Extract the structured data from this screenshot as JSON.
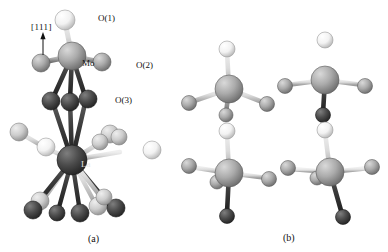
{
  "figure": {
    "background_color": "#ffffff",
    "width": 388,
    "height": 252
  },
  "panels": [
    {
      "id": "a",
      "caption": "(a)",
      "caption_x": 88,
      "caption_y": 234,
      "description": "MoO6 octahedron linked to LaO12 polyhedron viewed along [111]"
    },
    {
      "id": "b",
      "caption": "(b)",
      "caption_x": 283,
      "caption_y": 233,
      "description": "Four MoO6 coordination units shown in 2x2 arrangement"
    }
  ],
  "direction_indicator": {
    "label": "[111]",
    "label_x": 31,
    "label_y": 23,
    "arrow_from_x": 43,
    "arrow_from_y": 55,
    "arrow_to_x": 43,
    "arrow_to_y": 36
  },
  "atom_labels": [
    {
      "text": "O(1)",
      "x": 98,
      "y": 14,
      "style": "plain"
    },
    {
      "text": "Mo",
      "x": 82,
      "y": 59,
      "style": "on-sphere"
    },
    {
      "text": "O(2)",
      "x": 136,
      "y": 61,
      "style": "plain"
    },
    {
      "text": "O(3)",
      "x": 115,
      "y": 96,
      "style": "plain"
    },
    {
      "text": "La",
      "x": 81,
      "y": 160,
      "style": "on-dark"
    }
  ],
  "colors": {
    "atom_white_fill": "#fdfdfd",
    "atom_white_highlight": "#ffffff",
    "atom_white_shadow": "#b9b9b9",
    "atom_gray_fill": "#a8a8a8",
    "atom_gray_highlight": "#d8d8d8",
    "atom_gray_shadow": "#6e6e6e",
    "atom_dark_fill": "#4a4a4a",
    "atom_dark_highlight": "#7d7d7d",
    "atom_dark_shadow": "#242424",
    "atom_mid_fill": "#9a9a9a",
    "atom_lightgray_fill": "#c9c9c9",
    "bond_light": "#d2d2d2",
    "bond_gray": "#9e9e9e",
    "bond_dark": "#3a3a3a",
    "outline": "#4f4f4f",
    "text": "#111111"
  },
  "panel_a": {
    "bonds": [
      {
        "x1": 72,
        "y1": 56,
        "x2": 65,
        "y2": 22,
        "w": 5.0,
        "shade": "light"
      },
      {
        "x1": 72,
        "y1": 56,
        "x2": 44,
        "y2": 62,
        "w": 5.0,
        "shade": "gray"
      },
      {
        "x1": 72,
        "y1": 56,
        "x2": 100,
        "y2": 62,
        "w": 5.0,
        "shade": "gray"
      },
      {
        "x1": 72,
        "y1": 56,
        "x2": 52,
        "y2": 100,
        "w": 4.6,
        "shade": "dark"
      },
      {
        "x1": 72,
        "y1": 56,
        "x2": 70,
        "y2": 100,
        "w": 4.6,
        "shade": "dark"
      },
      {
        "x1": 72,
        "y1": 56,
        "x2": 86,
        "y2": 99,
        "w": 4.6,
        "shade": "dark"
      },
      {
        "x1": 72,
        "y1": 160,
        "x2": 52,
        "y2": 100,
        "w": 4.6,
        "shade": "dark"
      },
      {
        "x1": 72,
        "y1": 160,
        "x2": 70,
        "y2": 100,
        "w": 4.6,
        "shade": "dark"
      },
      {
        "x1": 72,
        "y1": 160,
        "x2": 86,
        "y2": 99,
        "w": 4.6,
        "shade": "dark"
      },
      {
        "x1": 72,
        "y1": 160,
        "x2": 44,
        "y2": 147,
        "w": 4.4,
        "shade": "light"
      },
      {
        "x1": 44,
        "y1": 147,
        "x2": 20,
        "y2": 133,
        "w": 4.4,
        "shade": "light"
      },
      {
        "x1": 72,
        "y1": 160,
        "x2": 100,
        "y2": 143,
        "w": 4.4,
        "shade": "light"
      },
      {
        "x1": 72,
        "y1": 160,
        "x2": 110,
        "y2": 136,
        "w": 4.4,
        "shade": "light"
      },
      {
        "x1": 72,
        "y1": 160,
        "x2": 120,
        "y2": 152,
        "w": 4.4,
        "shade": "light"
      },
      {
        "x1": 72,
        "y1": 160,
        "x2": 43,
        "y2": 200,
        "w": 4.4,
        "shade": "light"
      },
      {
        "x1": 72,
        "y1": 160,
        "x2": 35,
        "y2": 206,
        "w": 4.4,
        "shade": "dark"
      },
      {
        "x1": 72,
        "y1": 160,
        "x2": 58,
        "y2": 211,
        "w": 4.4,
        "shade": "dark"
      },
      {
        "x1": 72,
        "y1": 160,
        "x2": 80,
        "y2": 212,
        "w": 4.4,
        "shade": "dark"
      },
      {
        "x1": 72,
        "y1": 160,
        "x2": 96,
        "y2": 205,
        "w": 4.4,
        "shade": "light"
      },
      {
        "x1": 72,
        "y1": 160,
        "x2": 112,
        "y2": 208,
        "w": 4.4,
        "shade": "dark"
      },
      {
        "x1": 72,
        "y1": 160,
        "x2": 100,
        "y2": 196,
        "w": 4.4,
        "shade": "light"
      }
    ],
    "atoms": [
      {
        "x": 65,
        "y": 20,
        "r": 10,
        "kind": "white",
        "name": "oxygen-o1"
      },
      {
        "x": 41,
        "y": 63,
        "r": 9,
        "kind": "gray",
        "name": "oxygen-equatorial-left"
      },
      {
        "x": 102,
        "y": 62,
        "r": 9,
        "kind": "gray",
        "name": "oxygen-o2"
      },
      {
        "x": 72,
        "y": 56,
        "r": 14,
        "kind": "gray",
        "name": "molybdenum"
      },
      {
        "x": 51,
        "y": 101,
        "r": 9,
        "kind": "dark",
        "name": "oxygen-o3-a"
      },
      {
        "x": 70,
        "y": 102,
        "r": 9,
        "kind": "dark",
        "name": "oxygen-o3-b"
      },
      {
        "x": 88,
        "y": 99,
        "r": 9,
        "kind": "dark",
        "name": "oxygen-o3-c"
      },
      {
        "x": 19,
        "y": 132,
        "r": 9,
        "kind": "lightgray",
        "name": "oxygen-la-1"
      },
      {
        "x": 46,
        "y": 147,
        "r": 9,
        "kind": "white",
        "name": "oxygen-la-2"
      },
      {
        "x": 110,
        "y": 134,
        "r": 9,
        "kind": "lightgray",
        "name": "oxygen-la-3"
      },
      {
        "x": 119,
        "y": 137,
        "r": 8,
        "kind": "lightgray",
        "name": "oxygen-la-4"
      },
      {
        "x": 100,
        "y": 142,
        "r": 8,
        "kind": "lightgray",
        "name": "oxygen-la-5"
      },
      {
        "x": 152,
        "y": 150,
        "r": 9,
        "kind": "white",
        "name": "oxygen-la-6"
      },
      {
        "x": 72,
        "y": 160,
        "r": 15,
        "kind": "dark",
        "name": "lanthanum"
      },
      {
        "x": 40,
        "y": 201,
        "r": 9,
        "kind": "lightgray",
        "name": "oxygen-la-7"
      },
      {
        "x": 33,
        "y": 210,
        "r": 9,
        "kind": "dark",
        "name": "oxygen-la-8"
      },
      {
        "x": 57,
        "y": 213,
        "r": 8,
        "kind": "dark",
        "name": "oxygen-la-9"
      },
      {
        "x": 80,
        "y": 213,
        "r": 9,
        "kind": "dark",
        "name": "oxygen-la-10"
      },
      {
        "x": 98,
        "y": 206,
        "r": 9,
        "kind": "lightgray",
        "name": "oxygen-la-11"
      },
      {
        "x": 116,
        "y": 208,
        "r": 9,
        "kind": "dark",
        "name": "oxygen-la-12"
      },
      {
        "x": 104,
        "y": 197,
        "r": 8,
        "kind": "lightgray",
        "name": "oxygen-la-13"
      }
    ]
  },
  "panel_b": {
    "units": [
      {
        "name": "moo6-unit-top-left",
        "cx": 229,
        "cy": 89,
        "bonds": [
          {
            "dx": -2,
            "dy": -38,
            "w": 4.6,
            "shade": "light"
          },
          {
            "dx": -38,
            "dy": 13,
            "w": 4.6,
            "shade": "light"
          },
          {
            "dx": 36,
            "dy": 14,
            "w": 4.6,
            "shade": "light"
          },
          {
            "dx": -3,
            "dy": 24,
            "w": 4.6,
            "shade": "gray"
          }
        ],
        "atoms": [
          {
            "dx": -2,
            "dy": -40,
            "r": 8,
            "kind": "white",
            "name": "oxygen-apical"
          },
          {
            "dx": -40,
            "dy": 14,
            "r": 7.5,
            "kind": "gray",
            "name": "oxygen-equatorial-left"
          },
          {
            "dx": 38,
            "dy": 15,
            "r": 7.5,
            "kind": "gray",
            "name": "oxygen-equatorial-right"
          },
          {
            "dx": -3,
            "dy": 26,
            "r": 7,
            "kind": "gray",
            "name": "oxygen-lower"
          },
          {
            "dx": 0,
            "dy": 0,
            "r": 14,
            "kind": "gray",
            "name": "molybdenum"
          }
        ]
      },
      {
        "name": "moo6-unit-top-right",
        "cx": 325,
        "cy": 80,
        "bonds": [
          {
            "dx": 0,
            "dy": -38,
            "w": 4.6,
            "shade": "light"
          },
          {
            "dx": -38,
            "dy": 5,
            "w": 4.6,
            "shade": "light"
          },
          {
            "dx": 38,
            "dy": 5,
            "w": 4.6,
            "shade": "light"
          },
          {
            "dx": -2,
            "dy": 33,
            "w": 4.6,
            "shade": "dark"
          }
        ],
        "atoms": [
          {
            "dx": 0,
            "dy": -40,
            "r": 8,
            "kind": "white",
            "name": "oxygen-apical"
          },
          {
            "dx": -40,
            "dy": 6,
            "r": 7.5,
            "kind": "gray",
            "name": "oxygen-equatorial-left"
          },
          {
            "dx": 40,
            "dy": 6,
            "r": 7.5,
            "kind": "gray",
            "name": "oxygen-equatorial-right"
          },
          {
            "dx": -2,
            "dy": 35,
            "r": 7.5,
            "kind": "dark",
            "name": "oxygen-lower"
          },
          {
            "dx": 0,
            "dy": 0,
            "r": 14,
            "kind": "gray",
            "name": "molybdenum"
          }
        ]
      },
      {
        "name": "moo6-unit-bottom-left",
        "cx": 229,
        "cy": 173,
        "bonds": [
          {
            "dx": -2,
            "dy": -40,
            "w": 4.6,
            "shade": "light"
          },
          {
            "dx": -38,
            "dy": -6,
            "w": 4.6,
            "shade": "light"
          },
          {
            "dx": 38,
            "dy": 5,
            "w": 4.6,
            "shade": "light"
          },
          {
            "dx": -11,
            "dy": 8,
            "w": 4.2,
            "shade": "gray"
          },
          {
            "dx": -2,
            "dy": 40,
            "w": 4.6,
            "shade": "dark"
          }
        ],
        "atoms": [
          {
            "dx": -2,
            "dy": -42,
            "r": 8,
            "kind": "white",
            "name": "oxygen-apical"
          },
          {
            "dx": -40,
            "dy": -7,
            "r": 7.5,
            "kind": "gray",
            "name": "oxygen-equatorial-left"
          },
          {
            "dx": 40,
            "dy": 6,
            "r": 7.5,
            "kind": "gray",
            "name": "oxygen-equatorial-right"
          },
          {
            "dx": -12,
            "dy": 9,
            "r": 7,
            "kind": "gray",
            "name": "oxygen-front"
          },
          {
            "dx": -2,
            "dy": 43,
            "r": 7.5,
            "kind": "dark",
            "name": "oxygen-lower"
          },
          {
            "dx": 0,
            "dy": 0,
            "r": 14,
            "kind": "gray",
            "name": "molybdenum"
          }
        ]
      },
      {
        "name": "moo6-unit-bottom-right",
        "cx": 330,
        "cy": 172,
        "bonds": [
          {
            "dx": -5,
            "dy": -40,
            "w": 4.6,
            "shade": "light"
          },
          {
            "dx": -40,
            "dy": -3,
            "w": 4.6,
            "shade": "light"
          },
          {
            "dx": 40,
            "dy": -4,
            "w": 4.6,
            "shade": "light"
          },
          {
            "dx": -12,
            "dy": 5,
            "w": 4.2,
            "shade": "gray"
          },
          {
            "dx": 12,
            "dy": 42,
            "w": 4.6,
            "shade": "dark"
          }
        ],
        "atoms": [
          {
            "dx": -5,
            "dy": -42,
            "r": 8,
            "kind": "white",
            "name": "oxygen-apical"
          },
          {
            "dx": -42,
            "dy": -4,
            "r": 7.5,
            "kind": "gray",
            "name": "oxygen-equatorial-left"
          },
          {
            "dx": 42,
            "dy": -5,
            "r": 7.5,
            "kind": "gray",
            "name": "oxygen-equatorial-right"
          },
          {
            "dx": -13,
            "dy": 6,
            "r": 7,
            "kind": "gray",
            "name": "oxygen-front"
          },
          {
            "dx": 13,
            "dy": 45,
            "r": 7.5,
            "kind": "dark",
            "name": "oxygen-lower"
          },
          {
            "dx": 0,
            "dy": 0,
            "r": 14,
            "kind": "gray",
            "name": "molybdenum"
          }
        ]
      }
    ]
  }
}
